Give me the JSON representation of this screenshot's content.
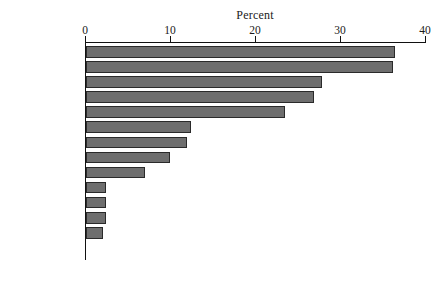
{
  "chart_data": {
    "type": "bar",
    "orientation": "horizontal",
    "title": "Percent",
    "xlabel": "Percent",
    "ylabel": "",
    "xlim": [
      0,
      40
    ],
    "xticks": [
      0,
      10,
      20,
      30,
      40
    ],
    "xtick_labels": [
      "0",
      "10",
      "20",
      "30",
      "40"
    ],
    "grid": false,
    "legend": false,
    "bar_color": "#6e6e6e",
    "bar_edge_color": "#2a2a2a",
    "axis_color": "#111111",
    "background": "#ffffff",
    "categories": [
      "Austria",
      "Canada",
      "Portugal",
      "Australia",
      "Netherlands",
      "U.S.",
      "Germany",
      "Denmark",
      "France",
      "Japan",
      "Switzerland",
      "Norway",
      "Iceland",
      "Sweden",
      "Finland"
    ],
    "values": [
      36.4,
      36.1,
      27.8,
      26.8,
      23.4,
      12.4,
      11.9,
      9.9,
      6.9,
      2.4,
      2.4,
      2.4,
      2.0,
      0,
      0
    ]
  }
}
